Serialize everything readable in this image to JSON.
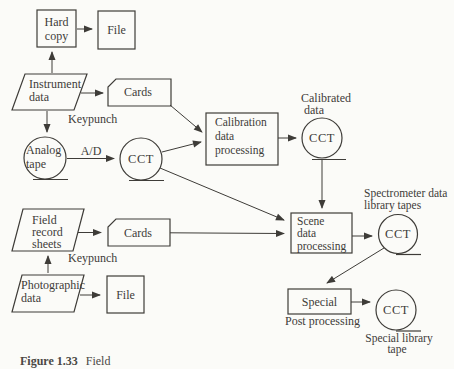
{
  "diagram": {
    "nodes": {
      "hard_copy": [
        "Hard",
        "copy"
      ],
      "file_top": "File",
      "instrument": [
        "Instrument",
        "data"
      ],
      "cards_top": "Cards",
      "analog_tape": [
        "Analog",
        "tape"
      ],
      "cct_main": "CCT",
      "calibration": [
        "Calibration",
        "data",
        "processing"
      ],
      "cct_calibrated": "CCT",
      "scene": [
        "Scene",
        "data",
        "processing"
      ],
      "cct_spectrometer": "CCT",
      "special": "Special",
      "cct_special": "CCT",
      "field_record": [
        "Field",
        "record",
        "sheets"
      ],
      "cards_bottom": "Cards",
      "photographic": [
        "Photographic",
        "data"
      ],
      "file_bottom": "File"
    },
    "annotations": {
      "keypunch_top": "Keypunch",
      "ad_converter": "A/D",
      "calibrated_data": [
        "Calibrated",
        "data"
      ],
      "spectrometer_tapes": [
        "Spectrometer data",
        "library tapes"
      ],
      "post_processing": "Post processing",
      "special_library": [
        "Special library",
        "tape"
      ],
      "keypunch_bottom": "Keypunch"
    },
    "caption": {
      "label": "Figure 1.33",
      "text": "Field"
    },
    "colors": {
      "ink": "#3e3c38",
      "paper": "#fbfbf8"
    }
  }
}
